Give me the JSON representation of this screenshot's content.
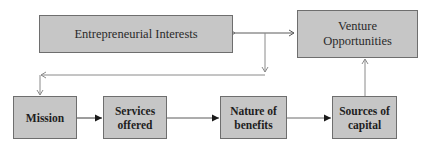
{
  "diagram": {
    "top_nodes": [
      {
        "id": "entrepreneurial-interests",
        "label": "Entrepreneurial Interests"
      },
      {
        "id": "venture-opportunities",
        "label": "Venture Opportunities",
        "lines": [
          "Venture",
          "Opportunities"
        ]
      }
    ],
    "bottom_nodes": [
      {
        "id": "mission",
        "label": "Mission",
        "lines": [
          "Mission"
        ]
      },
      {
        "id": "services-offered",
        "label": "Services offered",
        "lines": [
          "Services",
          "offered"
        ]
      },
      {
        "id": "nature-of-benefits",
        "label": "Nature of benefits",
        "lines": [
          "Nature of",
          "benefits"
        ]
      },
      {
        "id": "sources-of-capital",
        "label": "Sources of capital",
        "lines": [
          "Sources of",
          "capital"
        ]
      }
    ],
    "edges": [
      {
        "from": "entrepreneurial-interests",
        "to": "venture-opportunities",
        "type": "bidirectional"
      },
      {
        "from": "entrepreneurial-interests|venture-opportunities link",
        "to": "mission",
        "type": "elbow"
      },
      {
        "from": "mission",
        "to": "services-offered",
        "type": "arrow"
      },
      {
        "from": "services-offered",
        "to": "nature-of-benefits",
        "type": "arrow"
      },
      {
        "from": "nature-of-benefits",
        "to": "sources-of-capital",
        "type": "arrow"
      },
      {
        "from": "sources-of-capital",
        "to": "venture-opportunities",
        "type": "arrow"
      }
    ],
    "colors": {
      "box_fill": "#c6c6c6",
      "box_border": "#6e6e6e",
      "light_line": "#8a8a8a",
      "dark_line": "#3a3a3a"
    }
  }
}
